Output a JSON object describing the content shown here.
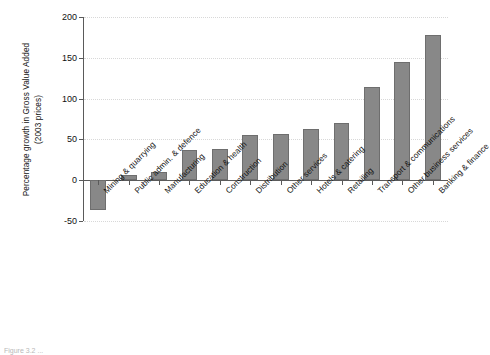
{
  "chart_data": {
    "type": "bar",
    "title": "",
    "xlabel": "",
    "ylabel": "Percentage growth in Gross Value Added (2003 prices)",
    "ylim": [
      -50,
      200
    ],
    "yticks": [
      -50,
      0,
      50,
      100,
      150,
      200
    ],
    "ytick_labels": [
      "-50",
      "0",
      "50",
      "100",
      "150",
      "200"
    ],
    "grid": true,
    "legend": "none",
    "bar_color": "#888888",
    "bar_edge_color": "#6e6e6e",
    "categories": [
      "Mining & quarrying",
      "Public admin. & defence",
      "Manufacturing",
      "Education & health",
      "Construction",
      "Distribution",
      "Other services",
      "Hotels & catering",
      "Retailing",
      "Transport & communications",
      "Other business services",
      "Banking & finance"
    ],
    "values": [
      -37,
      6,
      10,
      37,
      38,
      55,
      57,
      63,
      70,
      114,
      145,
      178
    ]
  },
  "axis": {
    "ylabel_line1": "Percentage growth in Gross Value Added",
    "ylabel_line2": "(2003 prices)"
  },
  "caption": {
    "text": "Figure 3.2 ..."
  }
}
